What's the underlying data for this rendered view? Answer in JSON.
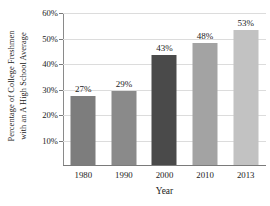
{
  "chart_data": {
    "type": "bar",
    "title": "",
    "subtitle": "",
    "xlabel": "Year",
    "ylabel": "Percentage of College Freshmen with an A High School Average",
    "ylabel_line1": "Percentage of College Freshmen",
    "ylabel_line2": "with an A High School Average",
    "categories": [
      "1980",
      "1990",
      "2000",
      "2010",
      "2013"
    ],
    "values": [
      27,
      29,
      43,
      48,
      53
    ],
    "value_labels": [
      "27%",
      "29%",
      "43%",
      "48%",
      "53%"
    ],
    "ylim": [
      0,
      60
    ],
    "ytick_values": [
      10,
      20,
      30,
      40,
      50,
      60
    ],
    "ytick_labels": [
      "10%",
      "20%",
      "30%",
      "40%",
      "50%",
      "60%"
    ],
    "grid": "horizontal",
    "legend": "none",
    "bar_colors": [
      "#7d7d7d",
      "#8a8a8a",
      "#4a4a4a",
      "#a3a3a3",
      "#c2c2c2"
    ],
    "axis_color": "#7a7a7a",
    "grid_color": "#dcdcdc",
    "text_color": "#1a1a1a",
    "background": "#ffffff"
  }
}
